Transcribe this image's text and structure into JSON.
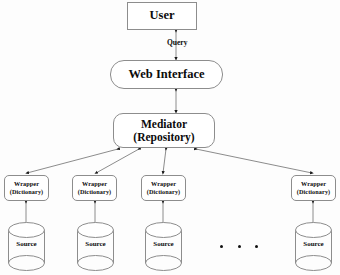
{
  "diagram": {
    "type": "block-diagram",
    "background_color": "#fdfdfd",
    "stroke_color": "#8d8d8d",
    "edge_color": "#555555",
    "text_color": "#0b0b0b"
  },
  "nodes": {
    "user": {
      "label": "User",
      "shape": "rectangle",
      "x": 127,
      "y": 2,
      "w": 70,
      "h": 28
    },
    "web_interface": {
      "label": "Web Interface",
      "shape": "rounded-rectangle",
      "x": 110,
      "y": 60,
      "w": 113,
      "h": 29
    },
    "mediator": {
      "label_line1": "Mediator",
      "label_line2": "(Repository)",
      "shape": "rounded-rectangle",
      "x": 113,
      "y": 113,
      "w": 102,
      "h": 35
    }
  },
  "wrappers": [
    {
      "label_line1": "Wrapper",
      "label_line2": "(Dictionary)",
      "x": 4,
      "center_x": 26
    },
    {
      "label_line1": "Wrapper",
      "label_line2": "(Dictionary)",
      "x": 72,
      "center_x": 95
    },
    {
      "label_line1": "Wrapper",
      "label_line2": "(Dictionary)",
      "x": 141,
      "center_x": 163
    },
    {
      "label_line1": "Wrapper",
      "label_line2": "(Dictionary)",
      "x": 291,
      "center_x": 313
    }
  ],
  "sources": [
    {
      "label": "Source",
      "x": 7,
      "center_x": 26
    },
    {
      "label": "Source",
      "x": 76,
      "center_x": 95
    },
    {
      "label": "Source",
      "x": 144,
      "center_x": 163
    },
    {
      "label": "Source",
      "x": 294,
      "center_x": 313
    }
  ],
  "edges": {
    "query_label": "Query",
    "user_to_web": {
      "from": "user",
      "to": "web_interface",
      "arrow": "bidirectional",
      "label": "Query"
    },
    "web_to_mediator": {
      "from": "web_interface",
      "to": "mediator",
      "arrow": "bidirectional"
    },
    "mediator_to_wrappers": {
      "arrow": "bidirectional",
      "count": 4
    },
    "wrappers_to_sources": {
      "arrow": "bidirectional",
      "count": 4
    }
  },
  "ellipsis": {
    "symbol": "...",
    "dot_count": 3,
    "meaning": "additional sources"
  }
}
